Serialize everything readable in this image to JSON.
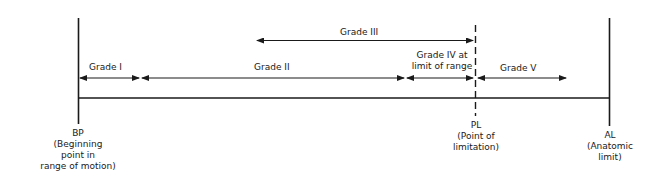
{
  "diagram": {
    "grades": {
      "grade_iii": "Grade III",
      "grade_i": "Grade I",
      "grade_ii": "Grade II",
      "grade_iv": "Grade IV at\nlimit of range",
      "grade_v": "Grade V"
    },
    "markers": {
      "bp": {
        "abbr": "BP",
        "desc": "(Beginning\npoint in\nrange of motion)"
      },
      "pl": {
        "abbr": "PL",
        "desc": "(Point of\nlimitation)"
      },
      "al": {
        "abbr": "AL",
        "desc": "(Anatomic\nlimit)"
      }
    },
    "colors": {
      "line": "#1a1a1a",
      "background": "#ffffff"
    }
  }
}
